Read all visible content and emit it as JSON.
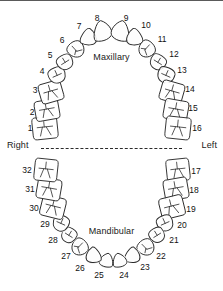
{
  "diagram": {
    "arch_labels": {
      "upper": "Maxillary",
      "lower": "Mandibular"
    },
    "side_labels": {
      "right": "Right",
      "left": "Left"
    },
    "midline": {
      "style": "dashed",
      "color": "#2b2b2b"
    },
    "colors": {
      "outline": "#2a2a2a",
      "fill": "#ffffff",
      "shade": "#efefef",
      "text": "#111111",
      "border": "#5a5a5a"
    },
    "teeth": [
      {
        "number": "1",
        "arch": "maxillary",
        "side": "right",
        "type": "molar",
        "cx": 45,
        "cy": 128,
        "rx": 12.5,
        "ry": 11.0,
        "rot": -6,
        "label_x": 30,
        "label_y": 128
      },
      {
        "number": "2",
        "arch": "maxillary",
        "side": "right",
        "type": "molar",
        "cx": 47,
        "cy": 110,
        "rx": 12.0,
        "ry": 10.0,
        "rot": -10,
        "label_x": 32,
        "label_y": 112
      },
      {
        "number": "3",
        "arch": "maxillary",
        "side": "right",
        "type": "molar",
        "cx": 51,
        "cy": 92,
        "rx": 11.5,
        "ry": 10.0,
        "rot": -16,
        "label_x": 35,
        "label_y": 90
      },
      {
        "number": "4",
        "arch": "maxillary",
        "side": "right",
        "type": "premolar",
        "cx": 57,
        "cy": 75,
        "rx": 9.0,
        "ry": 8.0,
        "rot": -24,
        "label_x": 42,
        "label_y": 71
      },
      {
        "number": "5",
        "arch": "maxillary",
        "side": "right",
        "type": "premolar",
        "cx": 65,
        "cy": 62,
        "rx": 8.5,
        "ry": 7.5,
        "rot": -32,
        "label_x": 50,
        "label_y": 55
      },
      {
        "number": "6",
        "arch": "maxillary",
        "side": "right",
        "type": "canine",
        "cx": 76,
        "cy": 49,
        "rx": 8.5,
        "ry": 8.5,
        "rot": -42,
        "label_x": 62,
        "label_y": 40
      },
      {
        "number": "7",
        "arch": "maxillary",
        "side": "right",
        "type": "incisor",
        "cx": 89,
        "cy": 38,
        "rx": 8.5,
        "ry": 8.0,
        "rot": -58,
        "label_x": 79,
        "label_y": 26
      },
      {
        "number": "8",
        "arch": "maxillary",
        "side": "right",
        "type": "incisor",
        "cx": 103,
        "cy": 32,
        "rx": 10.5,
        "ry": 9.0,
        "rot": -76,
        "label_x": 97,
        "label_y": 18
      },
      {
        "number": "9",
        "arch": "maxillary",
        "side": "left",
        "type": "incisor",
        "cx": 120,
        "cy": 32,
        "rx": 10.5,
        "ry": 9.0,
        "rot": 76,
        "label_x": 126,
        "label_y": 18
      },
      {
        "number": "10",
        "arch": "maxillary",
        "side": "left",
        "type": "incisor",
        "cx": 134,
        "cy": 38,
        "rx": 8.5,
        "ry": 8.0,
        "rot": 58,
        "label_x": 146,
        "label_y": 25
      },
      {
        "number": "11",
        "arch": "maxillary",
        "side": "left",
        "type": "canine",
        "cx": 147,
        "cy": 49,
        "rx": 8.5,
        "ry": 8.5,
        "rot": 42,
        "label_x": 162,
        "label_y": 39
      },
      {
        "number": "12",
        "arch": "maxillary",
        "side": "left",
        "type": "premolar",
        "cx": 158,
        "cy": 62,
        "rx": 8.5,
        "ry": 7.5,
        "rot": 32,
        "label_x": 174,
        "label_y": 54
      },
      {
        "number": "13",
        "arch": "maxillary",
        "side": "left",
        "type": "premolar",
        "cx": 166,
        "cy": 75,
        "rx": 9.0,
        "ry": 8.0,
        "rot": 24,
        "label_x": 182,
        "label_y": 70
      },
      {
        "number": "14",
        "arch": "maxillary",
        "side": "left",
        "type": "molar",
        "cx": 172,
        "cy": 92,
        "rx": 11.5,
        "ry": 10.0,
        "rot": 16,
        "label_x": 190,
        "label_y": 89
      },
      {
        "number": "15",
        "arch": "maxillary",
        "side": "left",
        "type": "molar",
        "cx": 176,
        "cy": 110,
        "rx": 12.0,
        "ry": 10.0,
        "rot": 10,
        "label_x": 193,
        "label_y": 108
      },
      {
        "number": "16",
        "arch": "maxillary",
        "side": "left",
        "type": "molar",
        "cx": 178,
        "cy": 128,
        "rx": 12.5,
        "ry": 11.0,
        "rot": 6,
        "label_x": 197,
        "label_y": 128
      },
      {
        "number": "17",
        "arch": "mandibular",
        "side": "left",
        "type": "molar",
        "cx": 178,
        "cy": 170,
        "rx": 11.5,
        "ry": 11.0,
        "rot": -6,
        "label_x": 196,
        "label_y": 171
      },
      {
        "number": "18",
        "arch": "mandibular",
        "side": "left",
        "type": "molar",
        "cx": 176,
        "cy": 189,
        "rx": 12.0,
        "ry": 10.5,
        "rot": -10,
        "label_x": 194,
        "label_y": 190
      },
      {
        "number": "19",
        "arch": "mandibular",
        "side": "left",
        "type": "molar",
        "cx": 172,
        "cy": 207,
        "rx": 12.0,
        "ry": 10.5,
        "rot": -14,
        "label_x": 191,
        "label_y": 209
      },
      {
        "number": "20",
        "arch": "mandibular",
        "side": "left",
        "type": "premolar",
        "cx": 165,
        "cy": 223,
        "rx": 8.5,
        "ry": 8.0,
        "rot": -24,
        "label_x": 182,
        "label_y": 225
      },
      {
        "number": "21",
        "arch": "mandibular",
        "side": "left",
        "type": "premolar",
        "cx": 157,
        "cy": 235,
        "rx": 8.0,
        "ry": 7.5,
        "rot": -32,
        "label_x": 174,
        "label_y": 240
      },
      {
        "number": "22",
        "arch": "mandibular",
        "side": "left",
        "type": "canine",
        "cx": 146,
        "cy": 247,
        "rx": 8.5,
        "ry": 8.5,
        "rot": -44,
        "label_x": 161,
        "label_y": 256
      },
      {
        "number": "23",
        "arch": "mandibular",
        "side": "left",
        "type": "incisor",
        "cx": 133,
        "cy": 256,
        "rx": 8.0,
        "ry": 7.5,
        "rot": -58,
        "label_x": 145,
        "label_y": 267
      },
      {
        "number": "24",
        "arch": "mandibular",
        "side": "left",
        "type": "incisor",
        "cx": 120,
        "cy": 261,
        "rx": 7.0,
        "ry": 7.0,
        "rot": -76,
        "label_x": 124,
        "label_y": 275
      },
      {
        "number": "25",
        "arch": "mandibular",
        "side": "right",
        "type": "incisor",
        "cx": 106,
        "cy": 261,
        "rx": 7.0,
        "ry": 7.0,
        "rot": 76,
        "label_x": 99,
        "label_y": 275
      },
      {
        "number": "26",
        "arch": "mandibular",
        "side": "right",
        "type": "incisor",
        "cx": 93,
        "cy": 256,
        "rx": 8.0,
        "ry": 7.5,
        "rot": 58,
        "label_x": 80,
        "label_y": 268
      },
      {
        "number": "27",
        "arch": "mandibular",
        "side": "right",
        "type": "canine",
        "cx": 80,
        "cy": 247,
        "rx": 8.5,
        "ry": 8.5,
        "rot": 44,
        "label_x": 66,
        "label_y": 256
      },
      {
        "number": "28",
        "arch": "mandibular",
        "side": "right",
        "type": "premolar",
        "cx": 69,
        "cy": 235,
        "rx": 8.0,
        "ry": 7.5,
        "rot": 32,
        "label_x": 53,
        "label_y": 240
      },
      {
        "number": "29",
        "arch": "mandibular",
        "side": "right",
        "type": "premolar",
        "cx": 61,
        "cy": 223,
        "rx": 8.5,
        "ry": 8.0,
        "rot": 24,
        "label_x": 45,
        "label_y": 224
      },
      {
        "number": "30",
        "arch": "mandibular",
        "side": "right",
        "type": "molar",
        "cx": 53,
        "cy": 207,
        "rx": 12.0,
        "ry": 10.5,
        "rot": 14,
        "label_x": 34,
        "label_y": 208
      },
      {
        "number": "31",
        "arch": "mandibular",
        "side": "right",
        "type": "molar",
        "cx": 49,
        "cy": 189,
        "rx": 12.0,
        "ry": 10.5,
        "rot": 10,
        "label_x": 30,
        "label_y": 189
      },
      {
        "number": "32",
        "arch": "mandibular",
        "side": "right",
        "type": "molar",
        "cx": 46,
        "cy": 170,
        "rx": 11.5,
        "ry": 11.0,
        "rot": 6,
        "label_x": 27,
        "label_y": 170
      }
    ]
  }
}
